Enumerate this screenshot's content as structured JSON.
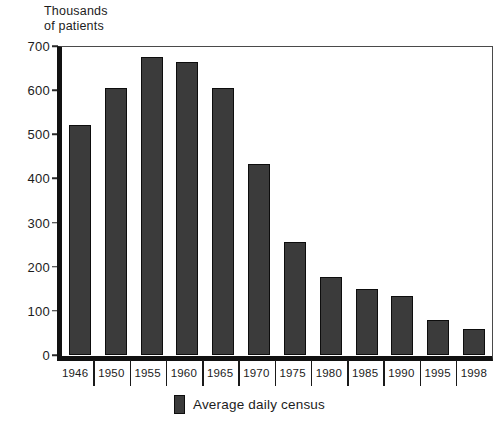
{
  "chart_data": {
    "type": "bar",
    "title": "",
    "ylabel": "Thousands\nof patients",
    "xlabel": "",
    "ylim": [
      0,
      700
    ],
    "ytick_step": 100,
    "yticks": [
      700,
      600,
      500,
      400,
      300,
      200,
      100,
      0
    ],
    "grid": false,
    "legend_position": "bottom-center",
    "categories": [
      "1946",
      "1950",
      "1955",
      "1960",
      "1965",
      "1970",
      "1975",
      "1980",
      "1985",
      "1990",
      "1995",
      "1998"
    ],
    "series": [
      {
        "name": "Average daily census",
        "values": [
          520,
          605,
          675,
          663,
          605,
          433,
          255,
          176,
          150,
          134,
          80,
          58
        ],
        "color": "#3b3b3b"
      }
    ]
  },
  "legend": {
    "entries": [
      {
        "label": "Average daily census",
        "swatch_color": "#3b3b3b"
      }
    ]
  },
  "axis": {
    "y_title": "Thousands\nof patients",
    "y_tick_labels": [
      "700",
      "600",
      "500",
      "400",
      "300",
      "200",
      "100",
      "0"
    ],
    "x_tick_labels": [
      "1946",
      "1950",
      "1955",
      "1960",
      "1965",
      "1970",
      "1975",
      "1980",
      "1985",
      "1990",
      "1995",
      "1998"
    ]
  },
  "colors": {
    "bar_fill": "#3b3b3b",
    "bar_stroke": "#0d0d0d",
    "axis_line": "#111111",
    "frame_line": "#4a4a4a",
    "text": "#1c1c1c",
    "background": "#ffffff"
  }
}
